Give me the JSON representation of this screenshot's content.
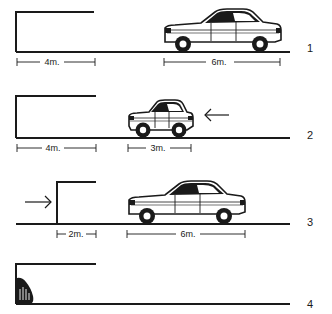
{
  "diagram": {
    "type": "parking-sequence",
    "colors": {
      "ink": "#1a1a1a",
      "background": "#ffffff"
    },
    "panels": [
      {
        "number": "1",
        "garage": {
          "depth_label": "4m."
        },
        "car": {
          "kind": "long-sedan",
          "length_label": "6m."
        },
        "arrow": null
      },
      {
        "number": "2",
        "garage": {
          "depth_label": "4m."
        },
        "car": {
          "kind": "compact-car",
          "length_label": "3m."
        },
        "arrow": {
          "direction": "left",
          "icon": "arrow-left-icon"
        }
      },
      {
        "number": "3",
        "garage": {
          "depth_label": "2m."
        },
        "car": {
          "kind": "long-sedan",
          "length_label": "6m."
        },
        "arrow": {
          "direction": "right",
          "icon": "arrow-right-icon"
        }
      },
      {
        "number": "4",
        "garage": {
          "depth_label": ""
        },
        "car": null,
        "fire": {
          "icon": "fire-icon"
        }
      }
    ]
  }
}
